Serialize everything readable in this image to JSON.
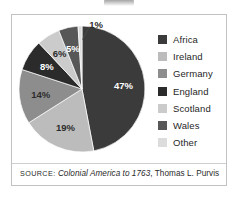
{
  "figure": {
    "title_remnant": "",
    "source_prefix": "SOURCE:",
    "source_work": "Colonial America to 1763",
    "source_author": ", Thomas L. Purvis"
  },
  "legend": {
    "items": [
      {
        "label": "Africa",
        "color": "#3b3b3b"
      },
      {
        "label": "Ireland",
        "color": "#bcbcbc"
      },
      {
        "label": "Germany",
        "color": "#8d8d8d"
      },
      {
        "label": "England",
        "color": "#2b2b2b"
      },
      {
        "label": "Scotland",
        "color": "#cbcbcb"
      },
      {
        "label": "Wales",
        "color": "#575757"
      },
      {
        "label": "Other",
        "color": "#dcdcdc"
      }
    ]
  },
  "labels": {
    "africa": "47%",
    "ireland": "19%",
    "germany": "14%",
    "england": "8%",
    "scotland": "6%",
    "wales": "5%",
    "other": "1%"
  },
  "chart_data": {
    "type": "pie",
    "title": "",
    "categories": [
      "Africa",
      "Ireland",
      "Germany",
      "England",
      "Scotland",
      "Wales",
      "Other"
    ],
    "values": [
      47,
      19,
      14,
      8,
      6,
      5,
      1
    ],
    "unit": "percent",
    "data_labels": [
      "47%",
      "19%",
      "14%",
      "8%",
      "6%",
      "5%",
      "1%"
    ],
    "colors": [
      "#3b3b3b",
      "#bcbcbc",
      "#8d8d8d",
      "#2b2b2b",
      "#cbcbcb",
      "#575757",
      "#dcdcdc"
    ],
    "legend_position": "right",
    "start_angle_deg": 0,
    "direction": "clockwise",
    "grid": false,
    "annotations": [
      {
        "text": "1%",
        "target_category": "Other",
        "style": "leader-line"
      }
    ],
    "source": "SOURCE: Colonial America to 1763, Thomas L. Purvis"
  }
}
